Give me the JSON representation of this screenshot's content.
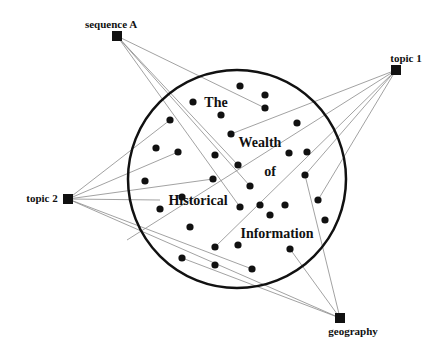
{
  "diagram": {
    "title_words": [
      {
        "text": "The",
        "x": 216,
        "y": 103
      },
      {
        "text": "Wealth",
        "x": 260,
        "y": 143
      },
      {
        "text": "of",
        "x": 270,
        "y": 172
      },
      {
        "text": "Historical",
        "x": 198,
        "y": 201
      },
      {
        "text": "Information",
        "x": 277,
        "y": 234
      }
    ],
    "circle": {
      "cx": 237,
      "cy": 179,
      "r": 109,
      "stroke": "#111111"
    },
    "nodes": [
      {
        "id": "sequenceA",
        "label": "sequence A",
        "x": 117,
        "y": 36,
        "label_x": 111,
        "label_y": 24
      },
      {
        "id": "topic1",
        "label": "topic 1",
        "x": 396,
        "y": 70,
        "label_x": 406,
        "label_y": 58
      },
      {
        "id": "topic2",
        "label": "topic 2",
        "x": 68,
        "y": 199,
        "label_x": 42,
        "label_y": 198
      },
      {
        "id": "geography",
        "label": "geography",
        "x": 340,
        "y": 318,
        "label_x": 353,
        "label_y": 331
      }
    ],
    "dots": [
      [
        240,
        86
      ],
      [
        265,
        95
      ],
      [
        265,
        108
      ],
      [
        193,
        102
      ],
      [
        221,
        115
      ],
      [
        231,
        134
      ],
      [
        170,
        120
      ],
      [
        156,
        148
      ],
      [
        178,
        152
      ],
      [
        215,
        155
      ],
      [
        238,
        165
      ],
      [
        297,
        123
      ],
      [
        289,
        153
      ],
      [
        307,
        152
      ],
      [
        145,
        181
      ],
      [
        213,
        179
      ],
      [
        250,
        186
      ],
      [
        260,
        205
      ],
      [
        240,
        207
      ],
      [
        182,
        197
      ],
      [
        160,
        209
      ],
      [
        190,
        227
      ],
      [
        270,
        215
      ],
      [
        285,
        205
      ],
      [
        305,
        175
      ],
      [
        318,
        200
      ],
      [
        325,
        220
      ],
      [
        215,
        247
      ],
      [
        238,
        245
      ],
      [
        290,
        249
      ],
      [
        182,
        258
      ],
      [
        215,
        265
      ],
      [
        252,
        269
      ]
    ],
    "edges": [
      {
        "from": "sequenceA",
        "to": [
          265,
          108
        ]
      },
      {
        "from": "sequenceA",
        "to": [
          238,
          165
        ]
      },
      {
        "from": "sequenceA",
        "to": [
          240,
          207
        ]
      },
      {
        "from": "sequenceA",
        "to": [
          250,
          186
        ]
      },
      {
        "from": "topic1",
        "to": [
          231,
          134
        ]
      },
      {
        "from": "topic1",
        "to": [
          215,
          247
        ]
      },
      {
        "from": "topic1",
        "to": [
          318,
          200
        ]
      },
      {
        "from": "topic1",
        "to": [
          127,
          240
        ]
      },
      {
        "from": "topic2",
        "to": [
          170,
          120
        ]
      },
      {
        "from": "topic2",
        "to": [
          178,
          152
        ]
      },
      {
        "from": "topic2",
        "to": [
          213,
          179
        ]
      },
      {
        "from": "topic2",
        "to": [
          252,
          269
        ]
      },
      {
        "from": "topic2",
        "to": [
          160,
          200
        ]
      },
      {
        "from": "topic2",
        "to": "geography"
      },
      {
        "from": "geography",
        "to": [
          290,
          249
        ]
      },
      {
        "from": "geography",
        "to": [
          305,
          175
        ]
      },
      {
        "from": "geography",
        "to": [
          182,
          258
        ]
      },
      {
        "from": "topic1",
        "to": [
          305,
          175
        ]
      }
    ],
    "colors": {
      "line": "#8a8a8a",
      "ink": "#111111"
    }
  }
}
